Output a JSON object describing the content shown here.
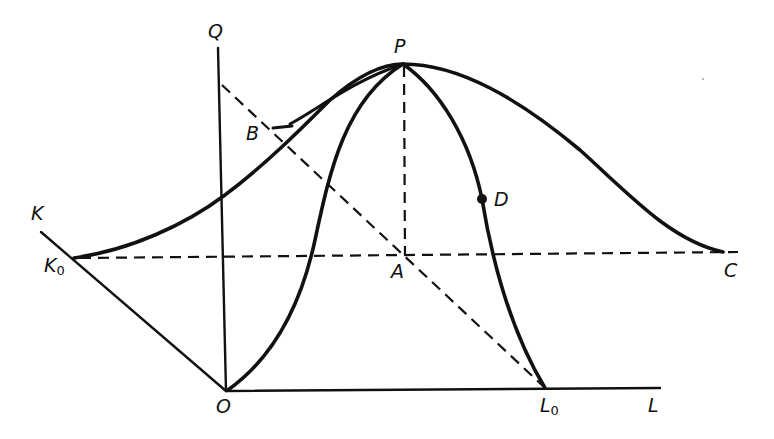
{
  "diagram": {
    "type": "geometric construction",
    "colors": {
      "ink": "#111111",
      "background": "#ffffff"
    },
    "labels": {
      "Q": "Q",
      "P": "P",
      "B": "B",
      "K": "K",
      "K0_main": "K",
      "K0_sub": "0",
      "A": "A",
      "D": "D",
      "C": "C",
      "O": "O",
      "L0_main": "L",
      "L0_sub": "0",
      "L": "L"
    },
    "points": {
      "O": [
        226,
        391
      ],
      "P": [
        403,
        64
      ],
      "A": [
        405,
        255
      ],
      "K0": [
        74,
        258
      ],
      "C": [
        723,
        252
      ],
      "L0": [
        545,
        388
      ],
      "D": [
        482,
        199
      ],
      "B": [
        273,
        128
      ]
    },
    "axes": [
      {
        "name": "Q-axis",
        "from": "O",
        "direction": "up"
      },
      {
        "name": "L-axis",
        "from": "O",
        "direction": "right"
      },
      {
        "name": "K-axis",
        "from": "O",
        "direction": "up-left"
      }
    ],
    "curves": [
      {
        "name": "outer-curve",
        "through": [
          "K0",
          "B",
          "P",
          "C"
        ]
      },
      {
        "name": "inner-curve",
        "through": [
          "O",
          "P",
          "D",
          "L0"
        ]
      }
    ],
    "dashed_lines": [
      {
        "name": "K0-C-line",
        "through": [
          "K0",
          "A",
          "C"
        ]
      },
      {
        "name": "P-A-line",
        "through": [
          "P",
          "A"
        ]
      },
      {
        "name": "diagonal-line",
        "through": [
          "Q-axis point",
          "B",
          "A",
          "L0"
        ]
      }
    ]
  }
}
